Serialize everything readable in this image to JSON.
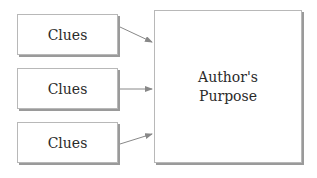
{
  "diagram": {
    "clues": [
      {
        "label": "Clues"
      },
      {
        "label": "Clues"
      },
      {
        "label": "Clues"
      }
    ],
    "target": {
      "line1": "Author's",
      "line2": "Purpose"
    },
    "colors": {
      "border": "#b8b8b8",
      "shadow": "#9a9a9a",
      "arrow": "#888888",
      "text": "#2a2a2a"
    }
  }
}
